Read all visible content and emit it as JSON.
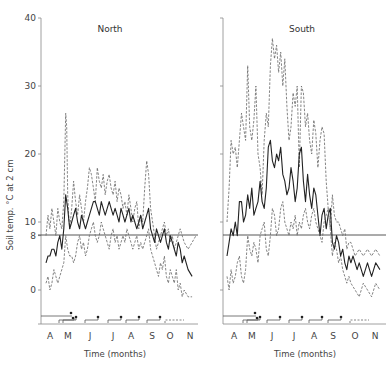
{
  "chart_data": [
    {
      "type": "line",
      "title": "North",
      "xlabel": "Time (months)",
      "ylabel": "Soil temp. °C at 2 cm",
      "ylim": [
        -5,
        40
      ],
      "yticks": [
        0,
        8,
        10,
        20,
        30,
        40
      ],
      "reference_line": 8,
      "categories": [
        "A",
        "M",
        "J",
        "J",
        "A",
        "S",
        "O",
        "N"
      ],
      "grid": false,
      "series": [
        {
          "name": "maximum",
          "style": "dashed",
          "x": [
            0.0,
            0.1,
            0.2,
            0.3,
            0.4,
            0.5,
            0.6,
            0.7,
            0.8,
            0.9,
            1.0,
            1.05,
            1.1,
            1.15,
            1.2,
            1.3,
            1.4,
            1.5,
            1.6,
            1.7,
            1.8,
            1.9,
            2.0,
            2.1,
            2.2,
            2.3,
            2.4,
            2.5,
            2.6,
            2.7,
            2.8,
            2.9,
            3.0,
            3.1,
            3.2,
            3.3,
            3.4,
            3.5,
            3.6,
            3.7,
            3.8,
            3.9,
            4.0,
            4.1,
            4.2,
            4.3,
            4.4,
            4.5,
            4.6,
            4.7,
            4.8,
            4.9,
            5.0,
            5.1,
            5.2,
            5.3,
            5.4,
            5.5,
            5.6,
            5.7,
            5.8,
            5.9,
            6.0,
            6.1,
            6.2,
            6.3,
            6.4,
            6.5,
            6.6,
            6.7,
            6.8,
            6.9,
            7.0,
            7.2,
            7.4,
            7.6
          ],
          "values": [
            8,
            11,
            9,
            12,
            10,
            8,
            12,
            10,
            9,
            13,
            26,
            24,
            14,
            11,
            9,
            12,
            16,
            13,
            11,
            14,
            12,
            10,
            13,
            15,
            18,
            17,
            15,
            13,
            18,
            16,
            15,
            17,
            14,
            16,
            17,
            15,
            14,
            16,
            13,
            15,
            14,
            12,
            13,
            11,
            14,
            12,
            10,
            12,
            13,
            9,
            11,
            10,
            15,
            19,
            17,
            12,
            10,
            8,
            6,
            7,
            8,
            9,
            10,
            8,
            9,
            7,
            8,
            6,
            7,
            8,
            9,
            8,
            7,
            6,
            7,
            8
          ]
        },
        {
          "name": "mean",
          "style": "solid",
          "x": [
            0.0,
            0.1,
            0.2,
            0.3,
            0.4,
            0.5,
            0.6,
            0.7,
            0.8,
            0.9,
            1.0,
            1.1,
            1.2,
            1.3,
            1.4,
            1.5,
            1.6,
            1.7,
            1.8,
            1.9,
            2.0,
            2.1,
            2.2,
            2.3,
            2.4,
            2.5,
            2.6,
            2.7,
            2.8,
            2.9,
            3.0,
            3.1,
            3.2,
            3.3,
            3.4,
            3.5,
            3.6,
            3.7,
            3.8,
            3.9,
            4.0,
            4.1,
            4.2,
            4.3,
            4.4,
            4.5,
            4.6,
            4.7,
            4.8,
            4.9,
            5.0,
            5.1,
            5.2,
            5.3,
            5.4,
            5.5,
            5.6,
            5.7,
            5.8,
            5.9,
            6.0,
            6.1,
            6.2,
            6.3,
            6.4,
            6.5,
            6.6,
            6.7,
            6.8,
            6.9,
            7.0,
            7.2,
            7.4
          ],
          "values": [
            4,
            5,
            5,
            6,
            6,
            5,
            7,
            8,
            6,
            9,
            14,
            12,
            9,
            10,
            11,
            12,
            10,
            9,
            11,
            10,
            9,
            10,
            11,
            12,
            13,
            13,
            12,
            11,
            13,
            12,
            11,
            12,
            13,
            12,
            11,
            12,
            11,
            10,
            12,
            11,
            10,
            11,
            12,
            10,
            11,
            10,
            9,
            10,
            11,
            9,
            10,
            11,
            12,
            9,
            8,
            7,
            9,
            8,
            7,
            8,
            9,
            7,
            6,
            8,
            7,
            6,
            5,
            7,
            6,
            4,
            5,
            3,
            2
          ]
        },
        {
          "name": "minimum",
          "style": "dashed",
          "x": [
            0.0,
            0.1,
            0.2,
            0.3,
            0.4,
            0.5,
            0.6,
            0.7,
            0.8,
            0.9,
            1.0,
            1.1,
            1.2,
            1.3,
            1.4,
            1.5,
            1.6,
            1.7,
            1.8,
            1.9,
            2.0,
            2.1,
            2.2,
            2.3,
            2.4,
            2.5,
            2.6,
            2.7,
            2.8,
            2.9,
            3.0,
            3.1,
            3.2,
            3.3,
            3.4,
            3.5,
            3.6,
            3.7,
            3.8,
            3.9,
            4.0,
            4.1,
            4.2,
            4.3,
            4.4,
            4.5,
            4.6,
            4.7,
            4.8,
            4.9,
            5.0,
            5.1,
            5.2,
            5.3,
            5.4,
            5.5,
            5.6,
            5.7,
            5.8,
            5.9,
            6.0,
            6.1,
            6.2,
            6.3,
            6.4,
            6.5,
            6.6,
            6.7,
            6.8,
            6.9,
            7.0,
            7.2,
            7.4
          ],
          "values": [
            1,
            2,
            0,
            1,
            3,
            2,
            1,
            2,
            3,
            4,
            8,
            6,
            5,
            5,
            4,
            5,
            7,
            8,
            6,
            7,
            5,
            6,
            8,
            9,
            10,
            8,
            7,
            8,
            10,
            9,
            8,
            7,
            6,
            8,
            9,
            7,
            8,
            6,
            7,
            8,
            7,
            9,
            8,
            7,
            6,
            7,
            8,
            6,
            7,
            6,
            7,
            8,
            9,
            6,
            5,
            4,
            3,
            2,
            4,
            3,
            5,
            2,
            1,
            3,
            2,
            1,
            3,
            0,
            1,
            -1,
            0,
            -1,
            -1
          ]
        }
      ],
      "bottom_markers": {
        "rows": 2,
        "note": "step bars with filled markers at month boundaries"
      }
    },
    {
      "type": "line",
      "title": "South",
      "xlabel": "Time (months)",
      "ylabel": "Soil temp. °C at 2 cm",
      "ylim": [
        -5,
        40
      ],
      "yticks": [
        0,
        10,
        20,
        30,
        40
      ],
      "reference_line": 8,
      "categories": [
        "A",
        "M",
        "J",
        "J",
        "A",
        "S",
        "O",
        "N"
      ],
      "grid": false,
      "series": [
        {
          "name": "maximum",
          "style": "dashed",
          "x": [
            0.0,
            0.1,
            0.2,
            0.3,
            0.4,
            0.5,
            0.6,
            0.7,
            0.8,
            0.9,
            1.0,
            1.1,
            1.2,
            1.3,
            1.4,
            1.5,
            1.6,
            1.7,
            1.8,
            1.9,
            2.0,
            2.1,
            2.2,
            2.3,
            2.4,
            2.5,
            2.6,
            2.7,
            2.8,
            2.9,
            3.0,
            3.1,
            3.2,
            3.3,
            3.4,
            3.5,
            3.6,
            3.7,
            3.8,
            3.9,
            4.0,
            4.1,
            4.2,
            4.3,
            4.4,
            4.5,
            4.6,
            4.7,
            4.8,
            4.9,
            5.0,
            5.1,
            5.2,
            5.3,
            5.4,
            5.5,
            5.6,
            5.7,
            5.8,
            5.9,
            6.0,
            6.2,
            6.4,
            6.6,
            6.8,
            7.0,
            7.2,
            7.4
          ],
          "values": [
            10,
            15,
            22,
            20,
            21,
            18,
            22,
            26,
            24,
            22,
            33,
            24,
            22,
            25,
            30,
            20,
            18,
            14,
            22,
            26,
            24,
            33,
            37,
            34,
            36,
            32,
            35,
            30,
            34,
            27,
            22,
            24,
            29,
            27,
            30,
            18,
            30,
            29,
            24,
            26,
            22,
            20,
            25,
            23,
            18,
            22,
            24,
            23,
            16,
            12,
            9,
            14,
            11,
            10,
            10,
            9,
            8,
            9,
            6,
            7,
            7,
            5,
            6,
            5,
            6,
            5,
            6,
            5
          ]
        },
        {
          "name": "mean",
          "style": "solid",
          "x": [
            0.0,
            0.1,
            0.2,
            0.3,
            0.4,
            0.5,
            0.6,
            0.7,
            0.8,
            0.9,
            1.0,
            1.1,
            1.2,
            1.3,
            1.4,
            1.5,
            1.6,
            1.7,
            1.8,
            1.9,
            2.0,
            2.1,
            2.2,
            2.3,
            2.4,
            2.5,
            2.6,
            2.7,
            2.8,
            2.9,
            3.0,
            3.1,
            3.2,
            3.3,
            3.4,
            3.5,
            3.6,
            3.7,
            3.8,
            3.9,
            4.0,
            4.1,
            4.2,
            4.3,
            4.4,
            4.5,
            4.6,
            4.7,
            4.8,
            4.9,
            5.0,
            5.1,
            5.2,
            5.3,
            5.4,
            5.5,
            5.6,
            5.7,
            5.8,
            5.9,
            6.0,
            6.1,
            6.2,
            6.3,
            6.4,
            6.5,
            6.6,
            6.7,
            6.8,
            6.9,
            7.0,
            7.2,
            7.4
          ],
          "values": [
            5,
            7,
            9,
            8,
            10,
            8,
            13,
            13,
            10,
            11,
            14,
            12,
            15,
            11,
            12,
            13,
            16,
            13,
            12,
            15,
            21,
            22,
            19,
            18,
            20,
            19,
            21,
            17,
            16,
            14,
            15,
            18,
            16,
            13,
            15,
            20,
            21,
            16,
            13,
            17,
            14,
            12,
            15,
            14,
            11,
            8,
            11,
            12,
            9,
            11,
            12,
            7,
            6,
            8,
            7,
            5,
            6,
            4,
            3,
            5,
            4,
            5,
            4,
            3,
            4,
            3,
            2,
            3,
            4,
            3,
            2,
            4,
            3
          ]
        },
        {
          "name": "minimum",
          "style": "dashed",
          "x": [
            0.0,
            0.1,
            0.2,
            0.3,
            0.4,
            0.5,
            0.6,
            0.7,
            0.8,
            0.9,
            1.0,
            1.1,
            1.2,
            1.3,
            1.4,
            1.5,
            1.6,
            1.7,
            1.8,
            1.9,
            2.0,
            2.1,
            2.2,
            2.3,
            2.4,
            2.5,
            2.6,
            2.7,
            2.8,
            2.9,
            3.0,
            3.1,
            3.2,
            3.3,
            3.4,
            3.5,
            3.6,
            3.7,
            3.8,
            3.9,
            4.0,
            4.1,
            4.2,
            4.3,
            4.4,
            4.5,
            4.6,
            4.7,
            4.8,
            4.9,
            5.0,
            5.1,
            5.2,
            5.3,
            5.4,
            5.5,
            5.6,
            5.7,
            5.8,
            5.9,
            6.0,
            6.2,
            6.4,
            6.6,
            6.8,
            7.0,
            7.2,
            7.4
          ],
          "values": [
            2,
            0,
            3,
            1,
            2,
            4,
            5,
            2,
            1,
            3,
            8,
            6,
            5,
            7,
            6,
            4,
            8,
            9,
            10,
            6,
            5,
            8,
            12,
            11,
            8,
            9,
            12,
            13,
            10,
            9,
            8,
            10,
            9,
            11,
            8,
            10,
            9,
            11,
            12,
            10,
            9,
            11,
            12,
            10,
            9,
            8,
            7,
            10,
            11,
            12,
            9,
            5,
            7,
            6,
            4,
            5,
            3,
            2,
            1,
            2,
            1,
            0,
            -1,
            1,
            0,
            -1,
            1,
            0
          ]
        }
      ],
      "bottom_markers": {
        "rows": 2,
        "note": "step bars with filled markers at month boundaries"
      }
    }
  ],
  "panels": {
    "north": {
      "title": "North"
    },
    "south": {
      "title": "South"
    }
  },
  "axes": {
    "ylabel": "Soil temp. °C at 2 cm",
    "xlabel_north": "Time  (months)",
    "xlabel_south": "Time (months)",
    "yticks_north": [
      "40",
      "30",
      "20",
      "10",
      "8",
      "0"
    ],
    "months": [
      "A",
      "M",
      "J",
      "J",
      "A",
      "S",
      "O",
      "N"
    ]
  },
  "colors": {
    "line": "#222222",
    "dashed": "#555555",
    "axis": "#777777",
    "text": "#444444"
  }
}
